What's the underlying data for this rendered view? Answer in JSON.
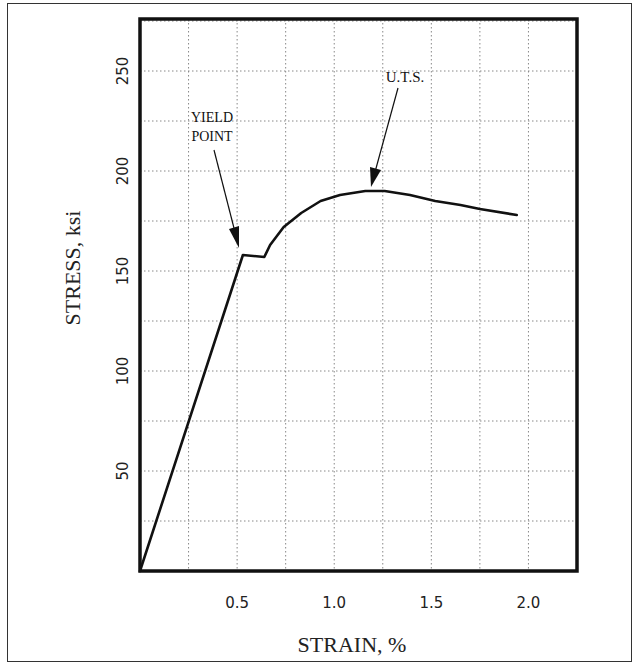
{
  "chart_data": {
    "type": "line",
    "title": "",
    "xlabel": "STRAIN, %",
    "ylabel": "STRESS, ksi",
    "xlim": [
      0,
      2.25
    ],
    "ylim": [
      0,
      276
    ],
    "x_ticks": [
      0.5,
      1.0,
      1.5,
      2.0
    ],
    "x_tick_labels": [
      "0.5",
      "1.0",
      "1.5",
      "2.0"
    ],
    "y_ticks": [
      50,
      100,
      150,
      200,
      250
    ],
    "y_tick_labels": [
      "50",
      "100",
      "150",
      "200",
      "250"
    ],
    "x_grid_step": 0.25,
    "y_grid_step": 25,
    "grid": true,
    "grid_style": "dotted",
    "legend": null,
    "series": [
      {
        "name": "stress-strain curve",
        "x": [
          0,
          0.53,
          0.64,
          0.67,
          0.74,
          0.83,
          0.93,
          1.03,
          1.16,
          1.26,
          1.39,
          1.52,
          1.65,
          1.75,
          1.94
        ],
        "y": [
          0,
          158,
          157,
          163,
          172,
          179,
          185,
          188,
          190,
          190,
          188,
          185,
          183,
          181,
          178
        ]
      }
    ],
    "annotations": [
      {
        "text_lines": [
          "YIELD",
          "POINT"
        ],
        "points_to": {
          "x": 0.51,
          "y": 161
        }
      },
      {
        "text_lines": [
          "U.T.S."
        ],
        "points_to": {
          "x": 1.19,
          "y": 193
        }
      }
    ]
  },
  "labels": {
    "xlabel": "STRAIN, %",
    "ylabel": "STRESS, ksi",
    "yield_line1": "YIELD",
    "yield_line2": "POINT",
    "uts": "U.T.S."
  }
}
